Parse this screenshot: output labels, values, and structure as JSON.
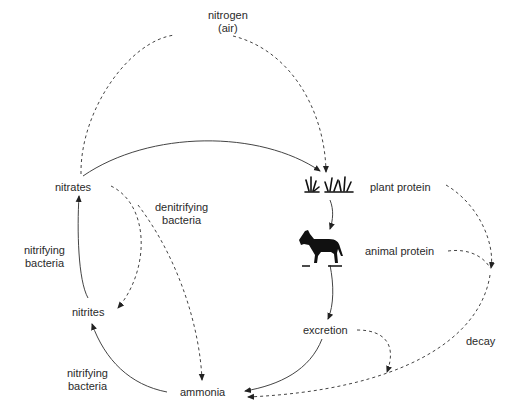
{
  "diagram": {
    "type": "cycle",
    "nodes": {
      "nitrogen_air": {
        "line1": "nitrogen",
        "line2": "(air)"
      },
      "nitrates": {
        "label": "nitrates"
      },
      "nitrites": {
        "label": "nitrites"
      },
      "ammonia": {
        "label": "ammonia"
      },
      "plant_protein": {
        "label": "plant protein"
      },
      "animal_protein": {
        "label": "animal protein"
      },
      "excretion": {
        "label": "excretion"
      }
    },
    "edge_labels": {
      "denitrifying": {
        "line1": "denitrifying",
        "line2": "bacteria"
      },
      "nitrifying_upper": {
        "line1": "nitrifying",
        "line2": "bacteria"
      },
      "nitrifying_lower": {
        "line1": "nitrifying",
        "line2": "bacteria"
      },
      "decay": {
        "label": "decay"
      }
    },
    "icons": [
      "grass-plants-icon",
      "horse-icon"
    ],
    "edges": [
      {
        "from": "nitrates",
        "to": "nitrogen_air",
        "style": "dashed"
      },
      {
        "from": "nitrogen_air",
        "to": "plant_protein",
        "style": "dashed"
      },
      {
        "from": "nitrates",
        "to": "plant_protein",
        "style": "solid"
      },
      {
        "from": "plant_protein",
        "to": "animal_protein",
        "style": "solid"
      },
      {
        "from": "animal_protein",
        "to": "excretion",
        "style": "solid"
      },
      {
        "from": "excretion",
        "to": "ammonia",
        "style": "solid"
      },
      {
        "from": "excretion",
        "to": "ammonia",
        "style": "dashed"
      },
      {
        "from": "plant_protein",
        "to": "ammonia",
        "style": "dashed",
        "label": "decay"
      },
      {
        "from": "animal_protein",
        "to": "ammonia",
        "style": "dashed",
        "label": "decay"
      },
      {
        "from": "ammonia",
        "to": "nitrites",
        "style": "solid",
        "label": "nitrifying bacteria"
      },
      {
        "from": "nitrites",
        "to": "nitrates",
        "style": "solid",
        "label": "nitrifying bacteria"
      },
      {
        "from": "nitrates",
        "to": "nitrites",
        "style": "dashed",
        "label": "denitrifying bacteria"
      },
      {
        "from": "nitrates",
        "to": "ammonia",
        "style": "dashed",
        "label": "denitrifying bacteria"
      }
    ]
  }
}
